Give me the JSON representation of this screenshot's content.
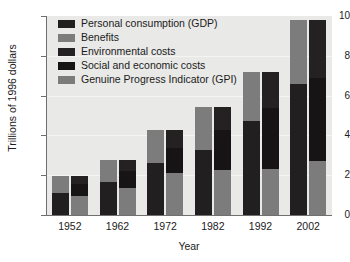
{
  "chart_data": {
    "type": "bar",
    "title": "",
    "subtitle": "",
    "xlabel": "Year",
    "ylabel": "Trillions of 1996 dollars",
    "categories": [
      "1952",
      "1962",
      "1972",
      "1982",
      "1992",
      "2002"
    ],
    "ylim": [
      0,
      10
    ],
    "yticks": [
      "0",
      "2",
      "4",
      "6",
      "8",
      "10"
    ],
    "ytick_values": [
      0,
      2,
      4,
      6,
      8,
      10
    ],
    "grid": true,
    "grid_axis": "y",
    "legend_position": "top-left-inside",
    "stacking": "paired-stacked",
    "series": [
      {
        "name": "Personal consumption (GDP)",
        "color": "#211f20",
        "bar": "left",
        "values": [
          1.1,
          1.65,
          2.6,
          3.25,
          4.7,
          6.6
        ]
      },
      {
        "name": "Benefits",
        "color": "#7c7c7c",
        "bar": "left",
        "values": [
          0.85,
          1.1,
          1.65,
          2.2,
          2.5,
          3.2
        ]
      },
      {
        "name": "Genuine Progress Indicator (GPI)",
        "color": "#7c7c7c",
        "bar": "right",
        "values": [
          0.95,
          1.35,
          2.1,
          2.25,
          2.3,
          2.7
        ]
      },
      {
        "name": "Social and economic costs",
        "color": "#161415",
        "bar": "right",
        "values": [
          0.6,
          0.85,
          1.25,
          2.0,
          3.1,
          4.2
        ]
      },
      {
        "name": "Environmental costs",
        "color": "#232122",
        "bar": "right",
        "values": [
          0.4,
          0.55,
          0.9,
          1.2,
          1.8,
          2.9
        ]
      }
    ],
    "totals": [
      1.95,
      2.75,
      4.25,
      5.45,
      7.2,
      9.8
    ]
  },
  "legend": {
    "items": [
      {
        "label": "Personal consumption (GDP)",
        "color": "#211f20",
        "swatch_name": "legend-swatch-gdp"
      },
      {
        "label": "Benefits",
        "color": "#7c7c7c",
        "swatch_name": "legend-swatch-benefits"
      },
      {
        "label": "Environmental costs",
        "color": "#232122",
        "swatch_name": "legend-swatch-environmental-costs"
      },
      {
        "label": "Social and economic costs",
        "color": "#161415",
        "swatch_name": "legend-swatch-social-economic-costs"
      },
      {
        "label": "Genuine Progress Indicator (GPI)",
        "color": "#7c7c7c",
        "swatch_name": "legend-swatch-gpi"
      }
    ]
  },
  "style": {
    "plot_background": "#e9e9e7",
    "figure_background": "#ffffff",
    "axis_color": "#6f6f6f",
    "text_color": "#1b1b1b",
    "gridline_color": "#f4f4f2"
  }
}
